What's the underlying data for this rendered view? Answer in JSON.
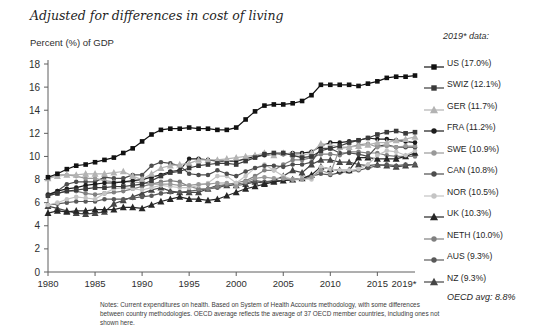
{
  "title": "Adjusted for differences in cost of living",
  "subtitle": "Percent (%) of GDP",
  "legend": {
    "heading": "2019* data:",
    "footer": "OECD avg: 8.8%"
  },
  "notes": {
    "lines": [
      "Notes: Current expenditures on health. Based on System of Health Accounts methodology, with some differences",
      "between country methodologies. OECD average reflects the average of 37 OECD member countries, including ones not",
      "shown here."
    ]
  },
  "axis": {
    "x_tick_labels": [
      "1980",
      "1985",
      "1990",
      "1995",
      "2000",
      "2005",
      "2010",
      "2015",
      "2019*"
    ],
    "x_tick_years": [
      1980,
      1985,
      1990,
      1995,
      2000,
      2005,
      2010,
      2015,
      2019
    ],
    "y_tick_labels": [
      "0",
      "2",
      "4",
      "6",
      "8",
      "10",
      "12",
      "14",
      "16",
      "18"
    ]
  },
  "chart_data": {
    "type": "line",
    "title": "Adjusted for differences in cost of living",
    "ylabel": "Percent (%) of GDP",
    "ylim": [
      0,
      18
    ],
    "yticks": [
      0,
      2,
      4,
      6,
      8,
      10,
      12,
      14,
      16,
      18
    ],
    "xlim": [
      1980,
      2019
    ],
    "grid": false,
    "legend_position": "right",
    "years": [
      1980,
      1981,
      1982,
      1983,
      1984,
      1985,
      1986,
      1987,
      1988,
      1989,
      1990,
      1991,
      1992,
      1993,
      1994,
      1995,
      1996,
      1997,
      1998,
      1999,
      2000,
      2001,
      2002,
      2003,
      2004,
      2005,
      2006,
      2007,
      2008,
      2009,
      2010,
      2011,
      2012,
      2013,
      2014,
      2015,
      2016,
      2017,
      2018,
      2019
    ],
    "series": [
      {
        "name": "US",
        "legend_label": "US (17.0%)",
        "value_2019": 17.0,
        "color": "#111111",
        "marker": "square",
        "values": [
          8.2,
          8.5,
          8.9,
          9.2,
          9.3,
          9.5,
          9.7,
          9.9,
          10.3,
          10.7,
          11.3,
          11.9,
          12.3,
          12.4,
          12.4,
          12.5,
          12.4,
          12.4,
          12.3,
          12.3,
          12.5,
          13.2,
          13.9,
          14.4,
          14.5,
          14.5,
          14.6,
          14.8,
          15.3,
          16.2,
          16.2,
          16.2,
          16.2,
          16.1,
          16.3,
          16.5,
          16.8,
          16.9,
          16.9,
          17.0
        ]
      },
      {
        "name": "SWIZ",
        "legend_label": "SWIZ (12.1%)",
        "value_2019": 12.1,
        "color": "#3a3a3a",
        "marker": "square",
        "values": [
          6.6,
          6.8,
          7.0,
          7.1,
          7.2,
          7.3,
          7.3,
          7.4,
          7.4,
          7.5,
          7.6,
          7.9,
          8.3,
          8.6,
          8.7,
          9.0,
          9.2,
          9.3,
          9.4,
          9.4,
          9.3,
          9.6,
          9.9,
          10.2,
          10.3,
          10.3,
          10.1,
          9.9,
          10.0,
          10.5,
          10.7,
          10.9,
          11.2,
          11.4,
          11.6,
          11.9,
          12.1,
          12.2,
          12.0,
          12.1
        ]
      },
      {
        "name": "GER",
        "legend_label": "GER (11.7%)",
        "value_2019": 11.7,
        "color": "#b3b3b3",
        "marker": "triangle",
        "values": [
          8.1,
          8.3,
          8.4,
          8.4,
          8.5,
          8.5,
          8.5,
          8.6,
          8.7,
          8.3,
          8.0,
          8.5,
          9.0,
          9.2,
          9.3,
          9.4,
          9.7,
          9.7,
          9.7,
          9.8,
          9.9,
          10.0,
          10.1,
          10.3,
          10.1,
          10.3,
          10.2,
          10.1,
          10.3,
          11.1,
          11.0,
          10.8,
          10.8,
          10.9,
          11.0,
          11.2,
          11.2,
          11.4,
          11.5,
          11.7
        ]
      },
      {
        "name": "FRA",
        "legend_label": "FRA (11.2%)",
        "value_2019": 11.2,
        "color": "#1c1c1c",
        "marker": "circle",
        "values": [
          6.7,
          7.0,
          7.2,
          7.3,
          7.5,
          7.6,
          7.7,
          7.7,
          7.8,
          7.9,
          8.0,
          8.2,
          8.4,
          8.7,
          8.8,
          9.8,
          9.8,
          9.7,
          9.6,
          9.6,
          9.6,
          9.8,
          10.0,
          10.1,
          10.2,
          10.2,
          10.3,
          10.3,
          10.4,
          10.9,
          11.2,
          11.2,
          11.3,
          11.4,
          11.6,
          11.5,
          11.5,
          11.4,
          11.3,
          11.2
        ]
      },
      {
        "name": "SWE",
        "legend_label": "SWE (10.9%)",
        "value_2019": 10.9,
        "color": "#999999",
        "marker": "circle",
        "values": [
          8.2,
          8.4,
          8.4,
          8.3,
          8.1,
          8.1,
          7.9,
          7.8,
          7.8,
          7.8,
          7.7,
          7.6,
          7.6,
          7.6,
          7.5,
          7.5,
          7.6,
          7.6,
          7.7,
          7.7,
          7.4,
          7.8,
          8.1,
          8.2,
          8.1,
          8.1,
          8.0,
          8.0,
          8.2,
          8.8,
          8.5,
          10.7,
          10.8,
          11.0,
          11.1,
          10.8,
          10.9,
          10.8,
          10.9,
          10.9
        ]
      },
      {
        "name": "CAN",
        "legend_label": "CAN (10.8%)",
        "value_2019": 10.8,
        "color": "#4d4d4d",
        "marker": "circle",
        "values": [
          6.6,
          7.0,
          7.6,
          7.8,
          7.8,
          7.8,
          8.2,
          8.1,
          8.1,
          8.4,
          8.4,
          9.2,
          9.5,
          9.4,
          9.2,
          8.5,
          8.4,
          8.4,
          8.8,
          8.5,
          8.3,
          8.7,
          9.0,
          9.2,
          9.2,
          9.1,
          9.3,
          9.3,
          9.5,
          10.7,
          10.7,
          10.3,
          10.3,
          10.2,
          10.0,
          10.9,
          11.0,
          10.8,
          10.8,
          10.8
        ]
      },
      {
        "name": "NOR",
        "legend_label": "NOR (10.5%)",
        "value_2019": 10.5,
        "color": "#c4c4c4",
        "marker": "circle",
        "values": [
          5.8,
          6.0,
          6.3,
          6.5,
          6.4,
          6.3,
          6.8,
          7.2,
          7.3,
          7.2,
          7.1,
          7.3,
          7.5,
          7.4,
          7.3,
          7.3,
          7.5,
          7.7,
          8.3,
          8.3,
          7.7,
          8.3,
          9.0,
          9.3,
          8.8,
          8.3,
          8.0,
          8.1,
          8.0,
          9.1,
          8.9,
          8.8,
          8.8,
          8.9,
          9.3,
          10.1,
          10.5,
          10.4,
          10.1,
          10.5
        ]
      },
      {
        "name": "UK",
        "legend_label": "UK (10.3%)",
        "value_2019": 10.3,
        "color": "#262626",
        "marker": "triangle",
        "values": [
          5.1,
          5.3,
          5.2,
          5.3,
          5.3,
          5.4,
          5.4,
          5.4,
          5.6,
          5.6,
          5.5,
          5.8,
          6.1,
          6.3,
          6.5,
          6.3,
          6.3,
          6.2,
          6.3,
          6.6,
          6.9,
          7.2,
          7.4,
          7.6,
          7.8,
          7.9,
          8.0,
          8.1,
          8.4,
          9.1,
          8.9,
          8.8,
          8.8,
          9.9,
          9.9,
          9.8,
          9.8,
          9.8,
          10.0,
          10.3
        ]
      },
      {
        "name": "NETH",
        "legend_label": "NETH (10.0%)",
        "value_2019": 10.0,
        "color": "#808080",
        "marker": "circle",
        "values": [
          6.6,
          6.8,
          7.0,
          7.0,
          6.8,
          6.7,
          6.8,
          6.9,
          7.0,
          7.2,
          7.4,
          7.6,
          7.8,
          7.9,
          7.8,
          7.4,
          7.2,
          7.2,
          7.4,
          7.6,
          7.7,
          7.9,
          8.3,
          8.8,
          8.8,
          9.3,
          9.7,
          9.7,
          9.9,
          10.2,
          10.2,
          10.1,
          10.4,
          10.4,
          10.3,
          10.3,
          10.1,
          10.0,
          10.0,
          10.0
        ]
      },
      {
        "name": "AUS",
        "legend_label": "AUS (9.3%)",
        "value_2019": 9.3,
        "color": "#595959",
        "marker": "circle",
        "values": [
          5.8,
          5.9,
          6.0,
          6.1,
          6.1,
          6.1,
          6.3,
          6.3,
          6.3,
          6.4,
          6.5,
          6.6,
          6.8,
          6.9,
          6.9,
          7.0,
          7.1,
          7.2,
          7.3,
          7.5,
          7.6,
          7.7,
          7.9,
          7.8,
          7.9,
          7.9,
          8.0,
          8.1,
          8.3,
          8.5,
          8.4,
          8.6,
          8.7,
          8.8,
          9.0,
          9.2,
          9.3,
          9.2,
          9.3,
          9.3
        ]
      },
      {
        "name": "NZ",
        "legend_label": "NZ (9.3%)",
        "value_2019": 9.3,
        "color": "#454545",
        "marker": "triangle",
        "values": [
          5.7,
          5.5,
          5.3,
          5.1,
          5.0,
          5.1,
          5.2,
          5.9,
          6.2,
          6.5,
          6.8,
          7.1,
          7.3,
          7.0,
          6.9,
          6.9,
          6.9,
          7.2,
          7.5,
          7.5,
          7.5,
          7.6,
          7.8,
          7.7,
          7.9,
          8.3,
          8.8,
          8.6,
          9.3,
          9.7,
          9.7,
          9.5,
          9.5,
          9.3,
          9.2,
          9.3,
          9.2,
          9.1,
          9.2,
          9.3
        ]
      }
    ],
    "oecd_avg_2019": 8.8
  }
}
